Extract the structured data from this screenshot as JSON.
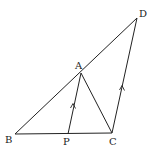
{
  "diagram": {
    "type": "geometry-figure",
    "points": {
      "A": {
        "label": "A",
        "x": 81,
        "y": 73
      },
      "B": {
        "label": "B",
        "x": 15,
        "y": 134
      },
      "C": {
        "label": "C",
        "x": 112,
        "y": 133
      },
      "D": {
        "label": "D",
        "x": 137,
        "y": 18
      },
      "P": {
        "label": "P",
        "x": 68,
        "y": 134
      }
    },
    "segments": [
      {
        "from": "B",
        "to": "D"
      },
      {
        "from": "B",
        "to": "C"
      },
      {
        "from": "A",
        "to": "C"
      },
      {
        "from": "P",
        "to": "A"
      },
      {
        "from": "C",
        "to": "D"
      }
    ],
    "parallel_marks": [
      {
        "segment": "PA",
        "symbol": "single-arrow"
      },
      {
        "segment": "CD",
        "symbol": "single-arrow"
      }
    ],
    "stroke_color": "#222222",
    "background": "#ffffff"
  }
}
